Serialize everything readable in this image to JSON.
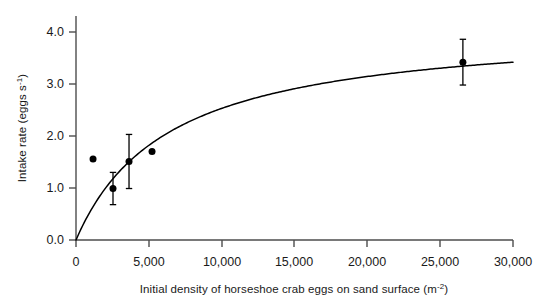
{
  "chart_data": {
    "type": "scatter",
    "title": "",
    "xlabel": "Initial density of horseshoe crab eggs on sand surface (m⁻²)",
    "xlabel_main": "Initial density of horseshoe crab eggs on sand surface (m",
    "xlabel_unit_base": "⁻²",
    "ylabel": "Intake rate (eggs s⁻¹)",
    "ylabel_main": "Intake rate (eggs s",
    "ylabel_sup": "-1",
    "ylabel_tail": ")",
    "xlim": [
      0,
      30000
    ],
    "ylim": [
      0,
      4.35
    ],
    "grid": false,
    "legend": "none",
    "xticks": [
      0,
      5000,
      10000,
      15000,
      20000,
      25000,
      30000
    ],
    "xtick_labels": [
      "0",
      "5,000",
      "10,000",
      "15,000",
      "20,000",
      "25,000",
      "30,000"
    ],
    "yticks": [
      0.0,
      1.0,
      2.0,
      3.0,
      4.0
    ],
    "ytick_labels": [
      "0.0",
      "1.0",
      "2.0",
      "3.0",
      "4.0"
    ],
    "points": [
      {
        "x": 1170,
        "y": 1.56,
        "yerr": 0.0
      },
      {
        "x": 2540,
        "y": 0.99,
        "yerr": 0.31
      },
      {
        "x": 3640,
        "y": 1.51,
        "yerr": 0.52
      },
      {
        "x": 5220,
        "y": 1.7,
        "yerr": 0.0
      },
      {
        "x": 26560,
        "y": 3.42,
        "yerr": 0.44
      }
    ],
    "fit_curve": {
      "model": "Michaelis-Menten",
      "equation": "y = Vmax * x / (Km + x)",
      "vmax": 4.15,
      "km": 6400,
      "x_range": [
        0,
        30000
      ]
    },
    "marker": {
      "shape": "circle",
      "color": "#000000",
      "size": 7
    },
    "line_color": "#000000",
    "axis_color": "#4d4d4d"
  }
}
